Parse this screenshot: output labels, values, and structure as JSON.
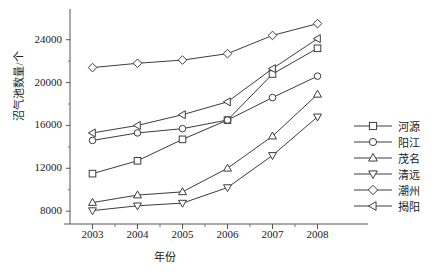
{
  "chart_data": {
    "type": "line",
    "title": "",
    "xlabel": "年份",
    "ylabel": "沼气池数量/个",
    "categories": [
      "2003",
      "2004",
      "2005",
      "2006",
      "2007",
      "2008"
    ],
    "x": [
      2003,
      2004,
      2005,
      2006,
      2007,
      2008
    ],
    "xlim": [
      2002.5,
      2008.5
    ],
    "ylim": [
      6800,
      26400
    ],
    "yticks": [
      8000,
      12000,
      16000,
      20000,
      24000
    ],
    "ytick_labels": [
      "8000",
      "12000",
      "16000",
      "20000",
      "24000"
    ],
    "grid": false,
    "legend_position": "right",
    "series": [
      {
        "name": "河源",
        "marker": "square",
        "values": [
          11500,
          12700,
          14700,
          16500,
          20800,
          23200
        ]
      },
      {
        "name": "阳江",
        "marker": "circle",
        "values": [
          14600,
          15300,
          15700,
          16500,
          18600,
          20600
        ]
      },
      {
        "name": "茂名",
        "marker": "triangle-up",
        "values": [
          8800,
          9500,
          9800,
          12000,
          15000,
          18900
        ]
      },
      {
        "name": "清远",
        "marker": "triangle-down",
        "values": [
          8050,
          8500,
          8750,
          10200,
          13200,
          16800
        ]
      },
      {
        "name": "潮州",
        "marker": "diamond",
        "values": [
          21400,
          21800,
          22100,
          22700,
          24400,
          25500
        ]
      },
      {
        "name": "揭阳",
        "marker": "triangle-left",
        "values": [
          15300,
          16000,
          17000,
          18200,
          21300,
          24100
        ]
      }
    ],
    "line_color": "#3c3c3c",
    "marker_fill": "#ffffff"
  },
  "legend": {
    "items": [
      {
        "label": "河源",
        "marker": "square"
      },
      {
        "label": "阳江",
        "marker": "circle"
      },
      {
        "label": "茂名",
        "marker": "triangle-up"
      },
      {
        "label": "清远",
        "marker": "triangle-down"
      },
      {
        "label": "潮州",
        "marker": "diamond"
      },
      {
        "label": "揭阳",
        "marker": "triangle-left"
      }
    ]
  }
}
